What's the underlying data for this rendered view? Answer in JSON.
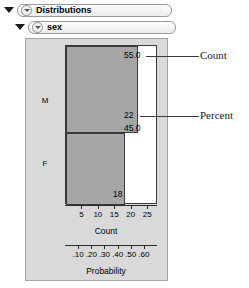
{
  "outliner": {
    "distributions": {
      "label": "Distributions",
      "disclosure_icon": "triangle-down-icon",
      "bullet_icon": "context-menu-triangle-icon"
    },
    "variable": {
      "label": "sex",
      "disclosure_icon": "triangle-down-icon",
      "bullet_icon": "context-menu-triangle-icon"
    }
  },
  "annotations": {
    "count_label": "Count",
    "percent_label": "Percent"
  },
  "chart_data": {
    "type": "bar",
    "title": "sex",
    "orientation": "horizontal",
    "categories": [
      "M",
      "F"
    ],
    "series": [
      {
        "name": "Count",
        "values": [
          22,
          18
        ]
      },
      {
        "name": "Percent",
        "values": [
          55.0,
          45.0
        ]
      }
    ],
    "value_labels": {
      "m_percent": "55.0",
      "m_count": "22",
      "f_percent": "45.0",
      "f_count": "18"
    },
    "axes": [
      {
        "name": "count",
        "label": "Count",
        "ticks": [
          "5",
          "10",
          "15",
          "20",
          "25"
        ],
        "range": [
          0,
          28
        ]
      },
      {
        "name": "probability",
        "label": "Probability",
        "ticks": [
          ".10",
          ".20",
          ".30",
          ".40",
          ".50",
          ".60"
        ],
        "range": [
          0,
          0.7
        ]
      }
    ],
    "grid": false,
    "legend": "none",
    "colors": {
      "bar_fill": "#a6a6a6",
      "bar_stroke": "#3a3a3a",
      "panel_background": "#d9d9d9",
      "plot_background": "#ffffff"
    }
  }
}
